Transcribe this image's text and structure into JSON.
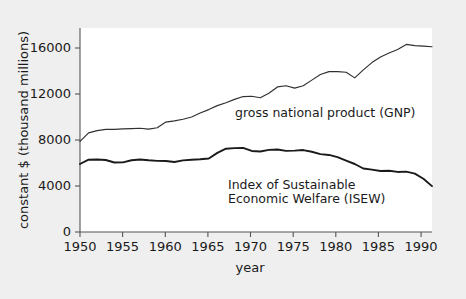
{
  "chart_data": {
    "type": "line",
    "title": "",
    "xlabel": "year",
    "ylabel": "constant $ (thousand millions)",
    "xlim": [
      1950,
      1991
    ],
    "ylim": [
      0,
      18000
    ],
    "xticks": [
      1950,
      1955,
      1960,
      1965,
      1970,
      1975,
      1980,
      1985,
      1990
    ],
    "yticks": [
      0,
      4000,
      8000,
      12000,
      16000
    ],
    "grid": false,
    "legend_position": "inline-annotation",
    "x": [
      1950,
      1951,
      1952,
      1953,
      1954,
      1955,
      1956,
      1957,
      1958,
      1959,
      1960,
      1961,
      1962,
      1963,
      1964,
      1965,
      1966,
      1967,
      1968,
      1969,
      1970,
      1971,
      1972,
      1973,
      1974,
      1975,
      1976,
      1977,
      1978,
      1979,
      1980,
      1981,
      1982,
      1983,
      1984,
      1985,
      1986,
      1987,
      1988,
      1989,
      1990,
      1991
    ],
    "series": [
      {
        "name": "gross national product (GNP)",
        "label": "gross national product (GNP)",
        "color": "#303030",
        "values": [
          8000,
          8750,
          8950,
          9050,
          9050,
          9100,
          9120,
          9150,
          9080,
          9200,
          9700,
          9800,
          9950,
          10150,
          10500,
          10800,
          11150,
          11400,
          11700,
          11950,
          11980,
          11850,
          12250,
          12800,
          12900,
          12700,
          12900,
          13400,
          13900,
          14150,
          14150,
          14100,
          13600,
          14300,
          14950,
          15450,
          15800,
          16100,
          16550,
          16450,
          16400,
          16350
        ]
      },
      {
        "name": "Index of Sustainable Economic Welfare (ISEW)",
        "label": "Index of Sustainable\nEconomic Welfare (ISEW)",
        "label_line1": "Index of Sustainable",
        "label_line2": "Economic Welfare (ISEW)",
        "color": "#1a1a1a",
        "values": [
          6000,
          6380,
          6400,
          6350,
          6130,
          6140,
          6330,
          6400,
          6330,
          6280,
          6270,
          6180,
          6320,
          6380,
          6420,
          6480,
          6980,
          7350,
          7400,
          7420,
          7150,
          7100,
          7250,
          7280,
          7160,
          7180,
          7230,
          7080,
          6870,
          6800,
          6600,
          6300,
          6000,
          5600,
          5500,
          5380,
          5400,
          5300,
          5330,
          5150,
          4700,
          4050
        ]
      }
    ]
  },
  "annotations": {
    "gnp": "gross national product (GNP)",
    "isew_line1": "Index of Sustainable",
    "isew_line2": "Economic Welfare (ISEW)"
  },
  "axes": {
    "x_label": "year",
    "y_label": "constant $ (thousand millions)",
    "x_tick_labels": [
      "1950",
      "1955",
      "1960",
      "1965",
      "1970",
      "1975",
      "1980",
      "1985",
      "1990"
    ],
    "y_tick_labels": [
      "0",
      "4000",
      "8000",
      "12000",
      "16000"
    ]
  },
  "colors": {
    "background": "#efefef",
    "plot_background": "#ffffff",
    "axis": "#555555",
    "gnp_line": "#303030",
    "isew_line": "#1a1a1a",
    "text": "#1a1a1a"
  }
}
